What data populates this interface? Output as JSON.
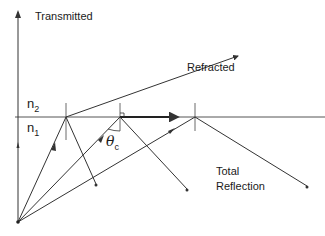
{
  "diagram": {
    "labels": {
      "transmitted": "Transmitted",
      "refracted": "Refracted",
      "total_reflection_line1": "Total",
      "total_reflection_line2": "Reflection",
      "n2": "n",
      "n2_sub": "2",
      "n1": "n",
      "n1_sub": "1",
      "theta": "θ",
      "theta_sub": "c"
    },
    "colors": {
      "line": "#333333",
      "surface": "#555555",
      "text": "#1a1a1a"
    },
    "geometry": {
      "source": [
        18,
        222
      ],
      "surface_y": 117,
      "incidence_points": [
        66,
        120,
        195
      ],
      "rays": [
        {
          "name": "normal-incidence",
          "from": [
            18,
            222
          ],
          "to": [
            18,
            20
          ],
          "type": "transmitted"
        },
        {
          "name": "sub-critical",
          "from": [
            18,
            222
          ],
          "to": [
            66,
            117
          ],
          "refracted_to": [
            240,
            55
          ],
          "reflected_to": [
            96,
            185
          ]
        },
        {
          "name": "critical",
          "from": [
            18,
            222
          ],
          "to": [
            120,
            117
          ],
          "grazing_to": [
            180,
            117
          ],
          "reflected_to": [
            187,
            190
          ]
        },
        {
          "name": "beyond-critical",
          "from": [
            18,
            222
          ],
          "to": [
            195,
            117
          ],
          "reflected_to": [
            307,
            187
          ]
        }
      ]
    }
  }
}
